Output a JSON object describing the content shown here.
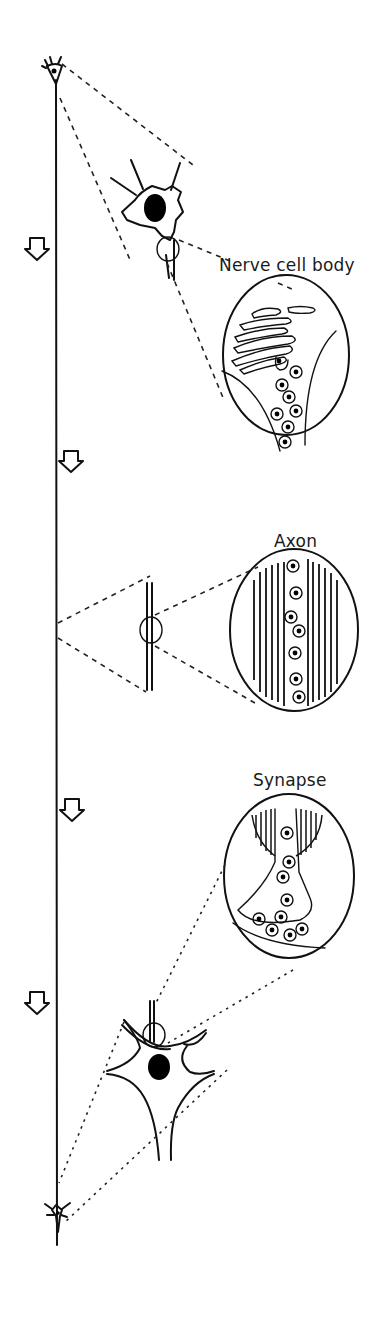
{
  "diagram": {
    "type": "neuron-transport-illustration",
    "labels": {
      "cell_body": "Nerve cell body",
      "axon": "Axon",
      "synapse": "Synapse"
    },
    "arrows": {
      "count": 4,
      "direction": "down",
      "meaning": "direction of transport along axon"
    },
    "colors": {
      "ink": "#111111",
      "background": "#ffffff"
    }
  }
}
